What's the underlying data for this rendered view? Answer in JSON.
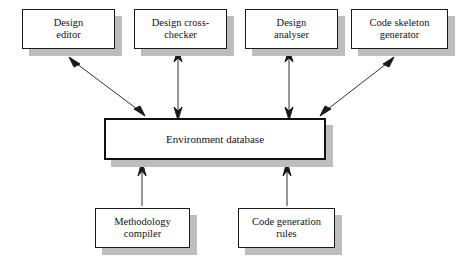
{
  "diagram": {
    "type": "block-diagram",
    "background_color": "#ffffff",
    "box_fill": "#ffffff",
    "box_border_color": "#1a1a1a",
    "shadow_color": "#bdbdbd",
    "arrow_color": "#1a1a1a",
    "nodes": [
      {
        "id": "design-editor",
        "label": "Design\neditor",
        "role": "tool",
        "x": 22,
        "y": 9,
        "w": 93,
        "h": 40
      },
      {
        "id": "design-cross-checker",
        "label": "Design cross-\nchecker",
        "role": "tool",
        "x": 134,
        "y": 9,
        "w": 93,
        "h": 40
      },
      {
        "id": "design-analyser",
        "label": "Design\nanalyser",
        "role": "tool",
        "x": 245,
        "y": 9,
        "w": 93,
        "h": 40
      },
      {
        "id": "code-skeleton-generator",
        "label": "Code skeleton\ngenerator",
        "role": "tool",
        "x": 351,
        "y": 9,
        "w": 97,
        "h": 40
      },
      {
        "id": "environment-database",
        "label": "Environment database",
        "role": "db",
        "x": 104,
        "y": 118,
        "w": 222,
        "h": 42
      },
      {
        "id": "methodology-compiler",
        "label": "Methodology\ncompiler",
        "role": "source",
        "x": 95,
        "y": 208,
        "w": 95,
        "h": 40
      },
      {
        "id": "code-generation-rules",
        "label": "Code generation\nrules",
        "role": "source",
        "x": 238,
        "y": 208,
        "w": 97,
        "h": 40
      }
    ],
    "edges": [
      {
        "id": "edge-design-editor",
        "from": "environment-database",
        "to": "design-editor",
        "style": "double-headed",
        "orientation": "diagonal"
      },
      {
        "id": "edge-design-cross-checker",
        "from": "environment-database",
        "to": "design-cross-checker",
        "style": "double-headed",
        "orientation": "vertical"
      },
      {
        "id": "edge-design-analyser",
        "from": "environment-database",
        "to": "design-analyser",
        "style": "double-headed",
        "orientation": "vertical"
      },
      {
        "id": "edge-code-skeleton-generator",
        "from": "environment-database",
        "to": "code-skeleton-generator",
        "style": "double-headed",
        "orientation": "diagonal"
      },
      {
        "id": "edge-methodology-compiler",
        "from": "methodology-compiler",
        "to": "environment-database",
        "style": "single-headed",
        "orientation": "vertical"
      },
      {
        "id": "edge-code-generation-rules",
        "from": "code-generation-rules",
        "to": "environment-database",
        "style": "single-headed",
        "orientation": "vertical"
      }
    ]
  }
}
